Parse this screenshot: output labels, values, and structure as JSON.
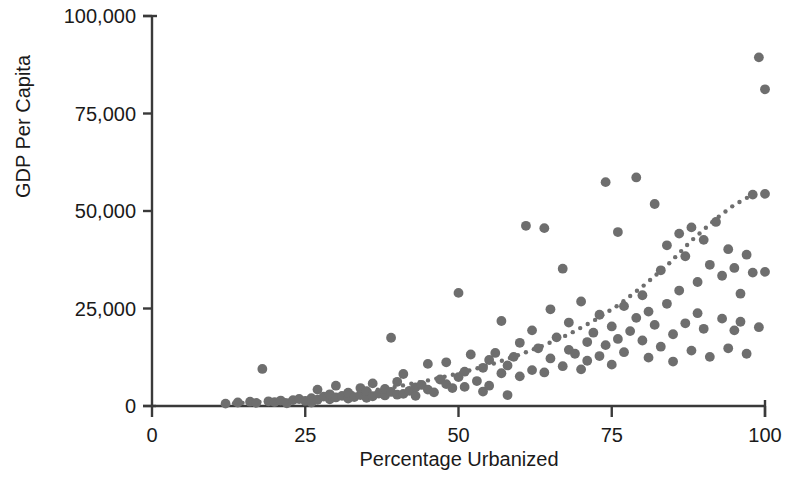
{
  "chart_data": {
    "type": "scatter",
    "title": "",
    "subtitle": "",
    "xlabel": "Percentage Urbanized",
    "ylabel": "GDP Per Capita",
    "xlim": [
      0,
      100
    ],
    "ylim": [
      0,
      100000
    ],
    "grid": false,
    "legend": null,
    "x_ticks": [
      0,
      25,
      50,
      75,
      100
    ],
    "x_tick_labels": [
      "0",
      "25",
      "50",
      "75",
      "100"
    ],
    "y_ticks": [
      0,
      25000,
      50000,
      75000,
      100000
    ],
    "y_tick_labels": [
      "0",
      "25,000",
      "50,000",
      "75,000",
      "100,000"
    ],
    "marker_color": "#6e6e6e",
    "axis_color": "#3a3a3a",
    "trend_color": "#6e6e6e",
    "marker_size": 7,
    "points": [
      [
        12,
        600
      ],
      [
        14,
        900
      ],
      [
        16,
        1100
      ],
      [
        17,
        800
      ],
      [
        18,
        9500
      ],
      [
        19,
        1200
      ],
      [
        20,
        1000
      ],
      [
        21,
        1400
      ],
      [
        22,
        700
      ],
      [
        23,
        1500
      ],
      [
        24,
        1800
      ],
      [
        25,
        1300
      ],
      [
        26,
        2000
      ],
      [
        26,
        900
      ],
      [
        27,
        1600
      ],
      [
        27,
        4200
      ],
      [
        28,
        2400
      ],
      [
        29,
        1700
      ],
      [
        29,
        3000
      ],
      [
        30,
        2200
      ],
      [
        30,
        5200
      ],
      [
        31,
        2600
      ],
      [
        32,
        1900
      ],
      [
        32,
        3400
      ],
      [
        33,
        2300
      ],
      [
        34,
        2800
      ],
      [
        34,
        4600
      ],
      [
        35,
        2100
      ],
      [
        35,
        3800
      ],
      [
        36,
        2500
      ],
      [
        36,
        5800
      ],
      [
        37,
        3200
      ],
      [
        38,
        2700
      ],
      [
        38,
        4400
      ],
      [
        39,
        3600
      ],
      [
        39,
        17500
      ],
      [
        40,
        2900
      ],
      [
        40,
        6200
      ],
      [
        41,
        3100
      ],
      [
        41,
        8200
      ],
      [
        42,
        3900
      ],
      [
        43,
        4800
      ],
      [
        43,
        2600
      ],
      [
        44,
        5400
      ],
      [
        45,
        4200
      ],
      [
        45,
        10800
      ],
      [
        46,
        3500
      ],
      [
        47,
        6800
      ],
      [
        48,
        5600
      ],
      [
        48,
        11200
      ],
      [
        49,
        4600
      ],
      [
        50,
        7400
      ],
      [
        50,
        29000
      ],
      [
        51,
        8800
      ],
      [
        51,
        4900
      ],
      [
        52,
        13200
      ],
      [
        53,
        6400
      ],
      [
        54,
        9800
      ],
      [
        54,
        3700
      ],
      [
        55,
        11800
      ],
      [
        55,
        5200
      ],
      [
        56,
        13600
      ],
      [
        57,
        8400
      ],
      [
        57,
        21800
      ],
      [
        58,
        10400
      ],
      [
        58,
        2800
      ],
      [
        59,
        12600
      ],
      [
        60,
        16200
      ],
      [
        60,
        7600
      ],
      [
        61,
        46200
      ],
      [
        62,
        19400
      ],
      [
        62,
        9200
      ],
      [
        63,
        14800
      ],
      [
        64,
        45600
      ],
      [
        64,
        8600
      ],
      [
        65,
        24800
      ],
      [
        65,
        12200
      ],
      [
        66,
        17600
      ],
      [
        67,
        10200
      ],
      [
        67,
        35200
      ],
      [
        68,
        14400
      ],
      [
        68,
        21400
      ],
      [
        69,
        13400
      ],
      [
        70,
        26800
      ],
      [
        70,
        9400
      ],
      [
        71,
        16400
      ],
      [
        71,
        11600
      ],
      [
        72,
        18800
      ],
      [
        73,
        23400
      ],
      [
        73,
        12800
      ],
      [
        74,
        57400
      ],
      [
        74,
        15600
      ],
      [
        75,
        20400
      ],
      [
        75,
        10600
      ],
      [
        76,
        44600
      ],
      [
        76,
        17200
      ],
      [
        77,
        25600
      ],
      [
        77,
        13800
      ],
      [
        78,
        19200
      ],
      [
        79,
        22600
      ],
      [
        79,
        58600
      ],
      [
        80,
        16800
      ],
      [
        80,
        28400
      ],
      [
        81,
        24200
      ],
      [
        81,
        12400
      ],
      [
        82,
        51800
      ],
      [
        82,
        20800
      ],
      [
        83,
        34800
      ],
      [
        83,
        15200
      ],
      [
        84,
        41200
      ],
      [
        84,
        26200
      ],
      [
        85,
        18400
      ],
      [
        85,
        11400
      ],
      [
        86,
        44200
      ],
      [
        86,
        29600
      ],
      [
        87,
        38400
      ],
      [
        87,
        21200
      ],
      [
        88,
        45800
      ],
      [
        88,
        14200
      ],
      [
        89,
        31800
      ],
      [
        89,
        23800
      ],
      [
        90,
        42600
      ],
      [
        90,
        19800
      ],
      [
        91,
        36200
      ],
      [
        91,
        12600
      ],
      [
        92,
        47200
      ],
      [
        93,
        22400
      ],
      [
        93,
        33400
      ],
      [
        94,
        14800
      ],
      [
        94,
        40200
      ],
      [
        95,
        35400
      ],
      [
        95,
        19400
      ],
      [
        96,
        21600
      ],
      [
        96,
        28800
      ],
      [
        97,
        13400
      ],
      [
        97,
        38800
      ],
      [
        98,
        34200
      ],
      [
        98,
        54200
      ],
      [
        99,
        89400
      ],
      [
        99,
        20200
      ],
      [
        100,
        81200
      ],
      [
        100,
        34400
      ],
      [
        100,
        54400
      ]
    ],
    "trendline": {
      "label": "fitted trend",
      "style": "dotted",
      "x": [
        12,
        16,
        20,
        24,
        28,
        32,
        36,
        40,
        44,
        48,
        52,
        56,
        60,
        64,
        68,
        72,
        76,
        80,
        84,
        88,
        92,
        95,
        98
      ],
      "y": [
        600,
        900,
        1300,
        1800,
        2400,
        3100,
        4000,
        5000,
        6200,
        7600,
        9200,
        11000,
        13200,
        15600,
        18400,
        21800,
        25800,
        30600,
        36000,
        42400,
        48000,
        51600,
        54200
      ]
    }
  },
  "axes": {
    "y_title": "GDP Per Capita",
    "x_title": "Percentage Urbanized"
  }
}
